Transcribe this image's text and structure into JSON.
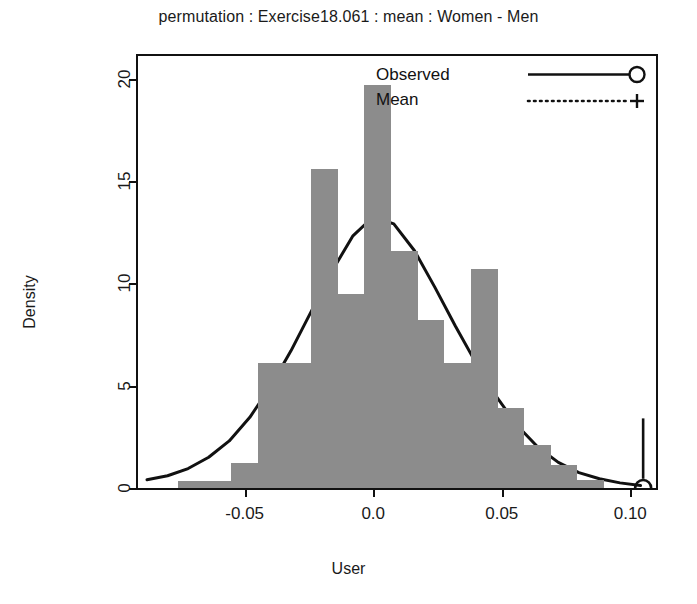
{
  "title": "permutation : Exercise18.061 : mean : Women - Men",
  "axes": {
    "xlabel": "User",
    "ylabel": "Density",
    "xticks": [
      "-0.05",
      "0.0",
      "0.05",
      "0.10"
    ],
    "yticks": [
      "0",
      "5",
      "10",
      "15",
      "20"
    ]
  },
  "legend": {
    "items": [
      {
        "label": "Observed",
        "key": "solid-line-circle-marker"
      },
      {
        "label": "Mean",
        "key": "dotted-line-plus-marker"
      }
    ]
  },
  "markers": {
    "observed_value": 0.105,
    "observed_icon": "circle-marker",
    "mean_value": 0.0,
    "mean_icon": "plus-marker"
  },
  "colors": {
    "bar_fill": "#8c8c8c",
    "line": "#111111",
    "axis": "#111111",
    "background": "#ffffff"
  },
  "chart_data": {
    "type": "bar",
    "title": "permutation : Exercise18.061 : mean : Women - Men",
    "xlabel": "User",
    "ylabel": "Density",
    "xlim": [
      -0.0915,
      0.11
    ],
    "ylim": [
      0,
      21.1
    ],
    "xticks": [
      -0.05,
      0.0,
      0.05,
      0.1
    ],
    "yticks": [
      0,
      5,
      10,
      15,
      20
    ],
    "grid": false,
    "legend_position": "top-right",
    "bin_width": 0.01035,
    "bin_starts": [
      -0.0759,
      -0.0655,
      -0.0552,
      -0.0448,
      -0.0345,
      -0.0241,
      -0.0138,
      -0.0034,
      0.0069,
      0.0173,
      0.0276,
      0.038,
      0.0483,
      0.0587,
      0.069,
      0.0794
    ],
    "values": [
      0.35,
      0.35,
      1.2,
      6.1,
      6.1,
      15.6,
      9.5,
      19.7,
      11.6,
      8.2,
      6.1,
      10.7,
      3.9,
      2.1,
      1.1,
      0.4
    ],
    "series": [
      {
        "name": "Density histogram",
        "type": "bar",
        "values": [
          0.35,
          0.35,
          1.2,
          6.1,
          6.1,
          15.6,
          9.5,
          19.7,
          11.6,
          8.2,
          6.1,
          10.7,
          3.9,
          2.1,
          1.1,
          0.4
        ]
      },
      {
        "name": "Density curve",
        "type": "line",
        "x": [
          -0.088,
          -0.08,
          -0.072,
          -0.064,
          -0.056,
          -0.048,
          -0.04,
          -0.032,
          -0.024,
          -0.016,
          -0.008,
          0.0,
          0.008,
          0.016,
          0.024,
          0.032,
          0.04,
          0.048,
          0.056,
          0.064,
          0.072,
          0.08,
          0.088,
          0.096,
          0.104
        ],
        "y": [
          0.4,
          0.6,
          0.95,
          1.5,
          2.3,
          3.45,
          4.95,
          6.7,
          8.65,
          10.6,
          12.3,
          13.25,
          12.9,
          11.6,
          9.8,
          7.9,
          6.1,
          4.45,
          3.05,
          2.0,
          1.25,
          0.75,
          0.45,
          0.25,
          0.12
        ]
      }
    ],
    "annotations": [
      {
        "name": "observed",
        "x": 0.105,
        "marker": "circle",
        "line": "vertical-solid"
      },
      {
        "name": "mean",
        "x": 0.0,
        "marker": "plus",
        "line": "vertical-dotted"
      }
    ]
  }
}
